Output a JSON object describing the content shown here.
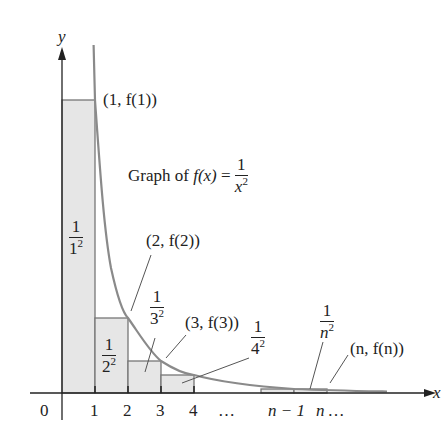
{
  "diagram": {
    "type": "area-under-curve-rectangles",
    "function_label_prefix": "Graph of ",
    "function_name": "f(x)",
    "function_equals": " = ",
    "function_num": "1",
    "function_den_base": "x",
    "function_den_exp": "2",
    "axes": {
      "x_label": "x",
      "y_label": "y",
      "origin_label": "0",
      "tick_labels": [
        "1",
        "2",
        "3",
        "4",
        "…",
        "n − 1",
        "n …"
      ]
    },
    "point_labels": {
      "p1": "(1, f(1))",
      "p2": "(2, f(2))",
      "p3": "(3, f(3))",
      "pn": "(n, f(n))"
    },
    "rect_labels": [
      {
        "num": "1",
        "base": "1",
        "exp": "2"
      },
      {
        "num": "1",
        "base": "2",
        "exp": "2"
      },
      {
        "num": "1",
        "base": "3",
        "exp": "2"
      },
      {
        "num": "1",
        "base": "4",
        "exp": "2"
      },
      {
        "num": "1",
        "base": "n",
        "exp": "2"
      }
    ],
    "colors": {
      "curve": "#8a8a8a",
      "rect_fill": "#e6e6e6",
      "rect_stroke": "#777777",
      "axis": "#222222"
    }
  }
}
